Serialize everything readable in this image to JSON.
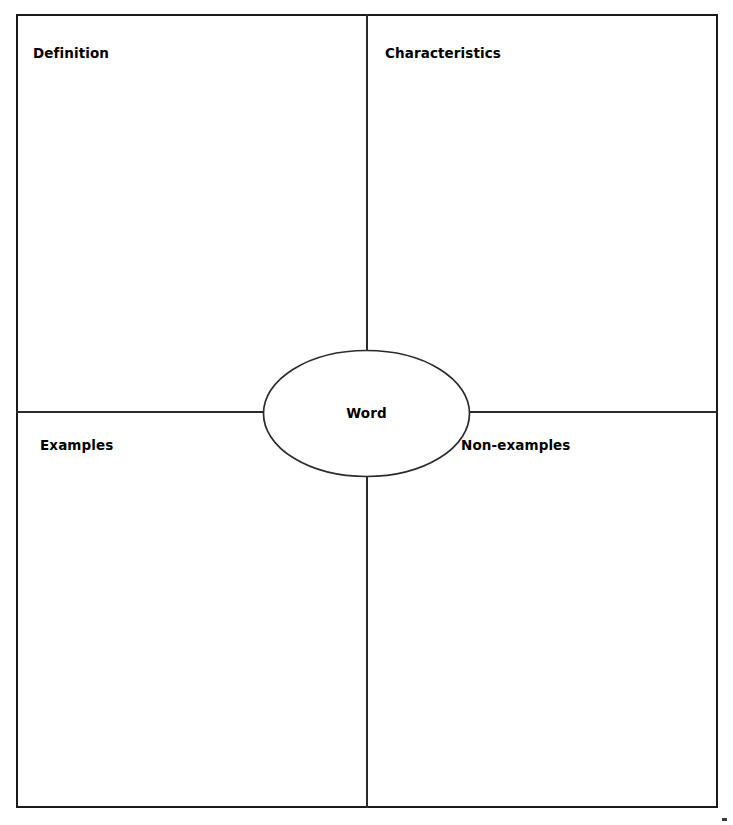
{
  "worksheet": {
    "type": "frayer-model",
    "center": {
      "label": "Word",
      "shape": "ellipse"
    },
    "quadrants": [
      {
        "id": "definition",
        "label": "Definition",
        "position": "top-left",
        "content": ""
      },
      {
        "id": "characteristics",
        "label": "Characteristics",
        "position": "top-right",
        "content": ""
      },
      {
        "id": "examples",
        "label": "Examples",
        "position": "bottom-left",
        "content": ""
      },
      {
        "id": "non-examples",
        "label": "Non-examples",
        "position": "bottom-right",
        "content": ""
      }
    ],
    "colors": {
      "frame": "#1a1a1a",
      "divider": "#2b2b2b",
      "text": "#000000",
      "background": "#ffffff"
    }
  }
}
